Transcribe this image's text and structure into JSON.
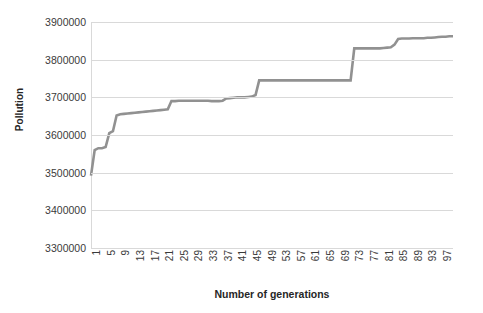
{
  "chart_data": {
    "type": "line",
    "title": "",
    "subtitle": "",
    "xlabel": "Number of generations",
    "ylabel": "Pollution",
    "grid": true,
    "legend": false,
    "legend_position": "none",
    "series_color": "#919191",
    "gridline_color": "#d9d9d9",
    "xlim": [
      1,
      100
    ],
    "ylim": [
      3300000,
      3900000
    ],
    "ytick_labels": [
      "3900000",
      "3800000",
      "3700000",
      "3600000",
      "3500000",
      "3400000",
      "3300000"
    ],
    "yticks": [
      3900000,
      3800000,
      3700000,
      3600000,
      3500000,
      3400000,
      3300000
    ],
    "xtick_labels": [
      "1",
      "5",
      "9",
      "13",
      "17",
      "21",
      "25",
      "29",
      "33",
      "37",
      "41",
      "45",
      "49",
      "53",
      "57",
      "61",
      "65",
      "69",
      "73",
      "77",
      "81",
      "85",
      "89",
      "93",
      "97"
    ],
    "xticks": [
      1,
      5,
      9,
      13,
      17,
      21,
      25,
      29,
      33,
      37,
      41,
      45,
      49,
      53,
      57,
      61,
      65,
      69,
      73,
      77,
      81,
      85,
      89,
      93,
      97
    ],
    "x": [
      1,
      2,
      3,
      4,
      5,
      6,
      7,
      8,
      9,
      10,
      11,
      12,
      13,
      14,
      15,
      16,
      17,
      18,
      19,
      20,
      21,
      22,
      23,
      24,
      25,
      26,
      27,
      28,
      29,
      30,
      31,
      32,
      33,
      34,
      35,
      36,
      37,
      38,
      39,
      40,
      41,
      42,
      43,
      44,
      45,
      46,
      47,
      48,
      49,
      50,
      51,
      52,
      53,
      54,
      55,
      56,
      57,
      58,
      59,
      60,
      61,
      62,
      63,
      64,
      65,
      66,
      67,
      68,
      69,
      70,
      71,
      72,
      73,
      74,
      75,
      76,
      77,
      78,
      79,
      80,
      81,
      82,
      83,
      84,
      85,
      86,
      87,
      88,
      89,
      90,
      91,
      92,
      93,
      94,
      95,
      96,
      97,
      98,
      99,
      100
    ],
    "values": [
      3492000,
      3560000,
      3565000,
      3565000,
      3568000,
      3605000,
      3610000,
      3652000,
      3655000,
      3656000,
      3657000,
      3658000,
      3659000,
      3660000,
      3661000,
      3662000,
      3663000,
      3664000,
      3665000,
      3666000,
      3667000,
      3668000,
      3690000,
      3690000,
      3691000,
      3691000,
      3691000,
      3691000,
      3691000,
      3691000,
      3691000,
      3691000,
      3691000,
      3690000,
      3690000,
      3690000,
      3691000,
      3697000,
      3698000,
      3699000,
      3700000,
      3700000,
      3700000,
      3701000,
      3702000,
      3706000,
      3745000,
      3745000,
      3745000,
      3745000,
      3745000,
      3745000,
      3745000,
      3745000,
      3745000,
      3745000,
      3745000,
      3745000,
      3745000,
      3745000,
      3745000,
      3745000,
      3745000,
      3745000,
      3745000,
      3745000,
      3745000,
      3745000,
      3745000,
      3745000,
      3745000,
      3745000,
      3830000,
      3830000,
      3830000,
      3830000,
      3830000,
      3830000,
      3830000,
      3830000,
      3831000,
      3832000,
      3833000,
      3840000,
      3855000,
      3856000,
      3856000,
      3856000,
      3857000,
      3857000,
      3857000,
      3857000,
      3858000,
      3858000,
      3859000,
      3860000,
      3861000,
      3861000,
      3862000,
      3862000
    ]
  }
}
